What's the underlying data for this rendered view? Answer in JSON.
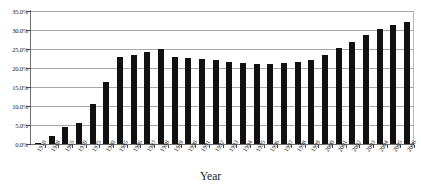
{
  "chart_data": {
    "type": "bar",
    "title": "",
    "xlabel": "Year",
    "ylabel": "",
    "ylim": [
      0,
      35
    ],
    "ytick_labels": [
      "0.0%",
      "5.0%",
      "10.0%",
      "15.0%",
      "20.0%",
      "25.0%",
      "30.0%",
      "35.0%"
    ],
    "ytick_values": [
      0,
      5,
      10,
      15,
      20,
      25,
      30,
      35
    ],
    "grid": true,
    "legend": "none",
    "bar_color": "#111114",
    "categories": [
      "1910",
      "1948",
      "1965",
      "1970",
      "1975",
      "1980",
      "1985",
      "1986",
      "1987",
      "1988",
      "1989",
      "1990",
      "1991",
      "1992",
      "1993",
      "1994",
      "1995",
      "1996",
      "1997",
      "1998",
      "1999",
      "2000",
      "2001",
      "2002",
      "2003",
      "2004",
      "2005",
      "2006"
    ],
    "values": [
      0.3,
      2.1,
      4.6,
      5.5,
      10.5,
      16.2,
      22.8,
      23.3,
      24.2,
      24.9,
      22.9,
      22.7,
      22.4,
      22.0,
      21.6,
      21.3,
      21.1,
      21.1,
      21.2,
      21.5,
      22.1,
      23.3,
      25.2,
      26.8,
      28.7,
      30.3,
      31.2,
      32.2
    ]
  },
  "axis": {
    "x_title": "Year"
  }
}
